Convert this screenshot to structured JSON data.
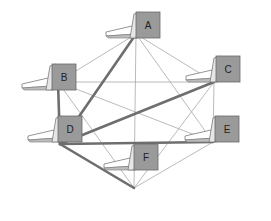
{
  "diagram": {
    "title": "",
    "node_icon": "laptop-computer-icon",
    "colors": {
      "thin_link": "#a8a8a8",
      "thick_link": "#6e6e6e",
      "device_body": "#9a9a9a",
      "device_screen": "#c8c8c8"
    },
    "nodes": [
      {
        "id": "A",
        "label": "A"
      },
      {
        "id": "B",
        "label": "B"
      },
      {
        "id": "C",
        "label": "C"
      },
      {
        "id": "D",
        "label": "D"
      },
      {
        "id": "E",
        "label": "E"
      },
      {
        "id": "F",
        "label": "F"
      }
    ],
    "edges": [
      {
        "from": "A",
        "to": "B",
        "weight": "thin"
      },
      {
        "from": "A",
        "to": "C",
        "weight": "thin"
      },
      {
        "from": "A",
        "to": "D",
        "weight": "thick"
      },
      {
        "from": "A",
        "to": "E",
        "weight": "thin"
      },
      {
        "from": "A",
        "to": "F",
        "weight": "thin"
      },
      {
        "from": "B",
        "to": "C",
        "weight": "thin"
      },
      {
        "from": "B",
        "to": "D",
        "weight": "thick"
      },
      {
        "from": "B",
        "to": "E",
        "weight": "thin"
      },
      {
        "from": "B",
        "to": "F",
        "weight": "thin"
      },
      {
        "from": "C",
        "to": "D",
        "weight": "thick"
      },
      {
        "from": "C",
        "to": "E",
        "weight": "thin"
      },
      {
        "from": "C",
        "to": "F",
        "weight": "thin"
      },
      {
        "from": "D",
        "to": "E",
        "weight": "thick"
      },
      {
        "from": "D",
        "to": "F",
        "weight": "thick"
      },
      {
        "from": "E",
        "to": "F",
        "weight": "thin"
      }
    ]
  }
}
